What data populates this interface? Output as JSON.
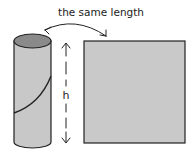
{
  "diagram": {
    "label_top": "the same length",
    "label_height": "h",
    "shapes": {
      "cylinder": {
        "description": "paper tube cylinder with seam line",
        "fill": "#c8c8c8",
        "top_fill": "#8a8a8a"
      },
      "rectangle": {
        "description": "unrolled rectangle of same height",
        "fill": "#c9c9c9"
      }
    },
    "annotations": [
      {
        "type": "curved-double-arrow",
        "meaning": "circumference equals rectangle width"
      },
      {
        "type": "vertical-dashed-double-arrow",
        "meaning": "height h"
      }
    ]
  }
}
